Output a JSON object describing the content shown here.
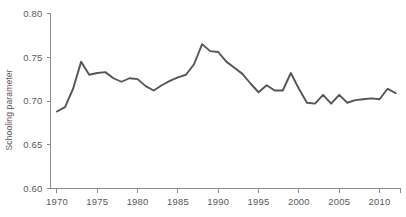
{
  "chart_data": {
    "type": "line",
    "title": "",
    "subtitle": "",
    "xlabel": "",
    "ylabel": "Schooling parameter",
    "xlim": [
      1969.2,
      1912.0
    ],
    "x_axis_range": [
      1969.2,
      2012.6
    ],
    "ylim": [
      0.6,
      0.8
    ],
    "grid": false,
    "legend": null,
    "legend_position": "none",
    "y_ticks": [
      0.6,
      0.65,
      0.7,
      0.75,
      0.8
    ],
    "y_tick_labels": [
      "0.60",
      "0.65",
      "0.70",
      "0.75",
      "0.80"
    ],
    "x_ticks": [
      1970,
      1975,
      1980,
      1985,
      1990,
      1995,
      2000,
      2005,
      2010
    ],
    "x_tick_labels": [
      "1970",
      "1975",
      "1980",
      "1985",
      "1990",
      "1995",
      "2000",
      "2005",
      "2010"
    ],
    "x_minor_ticks": [],
    "line_color": "#555557",
    "axis_color": "#8a8a8c",
    "text_color": "#58585a",
    "background_color": "#ffffff",
    "series": [
      {
        "name": "Schooling parameter",
        "x": [
          1970,
          1971,
          1972,
          1973,
          1974,
          1975,
          1976,
          1977,
          1978,
          1979,
          1980,
          1981,
          1982,
          1983,
          1984,
          1985,
          1986,
          1987,
          1988,
          1989,
          1990,
          1991,
          1992,
          1993,
          1994,
          1995,
          1996,
          1997,
          1998,
          1999,
          2000,
          2001,
          2002,
          2003,
          2004,
          2005,
          2006,
          2007,
          2008,
          2009,
          2010,
          2011,
          2012
        ],
        "values": [
          0.688,
          0.693,
          0.714,
          0.745,
          0.73,
          0.732,
          0.733,
          0.726,
          0.722,
          0.726,
          0.725,
          0.717,
          0.712,
          0.718,
          0.723,
          0.727,
          0.73,
          0.742,
          0.765,
          0.757,
          0.756,
          0.745,
          0.738,
          0.731,
          0.72,
          0.71,
          0.718,
          0.712,
          0.712,
          0.732,
          0.714,
          0.698,
          0.697,
          0.707,
          0.697,
          0.707,
          0.698,
          0.701,
          0.702,
          0.703,
          0.702,
          0.714,
          0.709
        ]
      }
    ],
    "annotations": []
  },
  "axes": {
    "y_axis_label": "Schooling parameter"
  }
}
